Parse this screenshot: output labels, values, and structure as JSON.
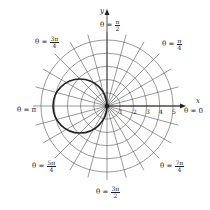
{
  "chart_data": {
    "type": "polar",
    "title": "",
    "curve": {
      "equation": "r = -4cos(theta)",
      "description": "circle centered at (-2,0) with radius 2, passing through origin",
      "color": "#222222",
      "stroke_width": 1.6
    },
    "radial_ticks": [
      "1",
      "2",
      "3",
      "4",
      "5"
    ],
    "radial_max": 5,
    "ray_step_degrees": 15,
    "axis_labels": {
      "x": "x",
      "y": "y"
    },
    "angle_labels": [
      {
        "id": "theta0",
        "prefix": "θ = ",
        "num": "0",
        "den": ""
      },
      {
        "id": "pi4",
        "prefix": "θ = ",
        "num": "π",
        "den": "4"
      },
      {
        "id": "pi2",
        "prefix": "θ = ",
        "num": "π",
        "den": "2"
      },
      {
        "id": "3pi4",
        "prefix": "θ = ",
        "num": "3π",
        "den": "4"
      },
      {
        "id": "pi",
        "prefix": "θ = ",
        "num": "π",
        "den": ""
      },
      {
        "id": "5pi4",
        "prefix": "θ = ",
        "num": "5π",
        "den": "4"
      },
      {
        "id": "3pi2",
        "prefix": "θ = ",
        "num": "3π",
        "den": "2"
      },
      {
        "id": "7pi4",
        "prefix": "θ = ",
        "num": "7π",
        "den": "4"
      }
    ],
    "grid": true,
    "colors": {
      "grid": "#555555",
      "curve": "#222222",
      "background": "#ffffff"
    }
  }
}
